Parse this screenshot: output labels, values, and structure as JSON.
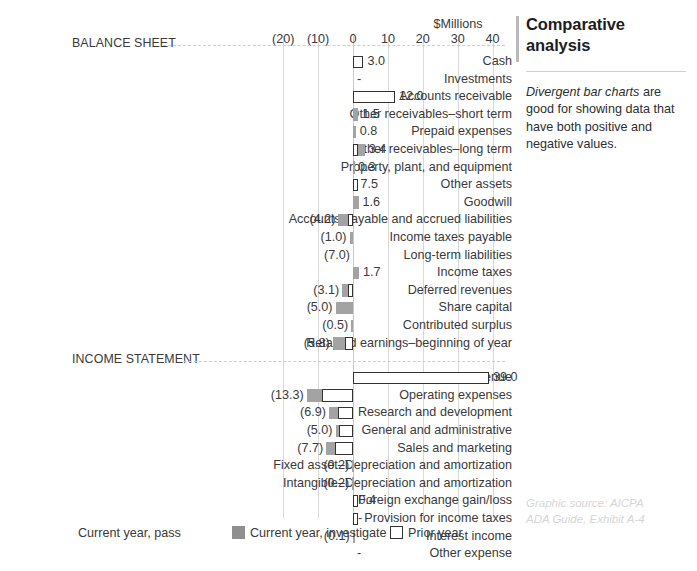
{
  "chart_data": {
    "type": "bar",
    "title": "",
    "xlabel": "$Millions",
    "ylabel": "",
    "orientation": "horizontal",
    "divergent": true,
    "xlim": [
      -25,
      45
    ],
    "xticks": [
      -20,
      -10,
      0,
      10,
      20,
      30,
      40
    ],
    "xtick_labels": [
      "(20)",
      "(10)",
      "0",
      "10",
      "20",
      "30",
      "40"
    ],
    "grid": true,
    "units_label": "$Millions",
    "legend": {
      "position": "bottom",
      "entries": [
        {
          "label": "Current year, pass",
          "swatch": "pass",
          "color": "#c9c9c9"
        },
        {
          "label": "Current year, investigate",
          "swatch": "investigate",
          "color": "#8f8f8f"
        },
        {
          "label": "Prior year",
          "swatch": "prior",
          "color": "#ffffff"
        }
      ]
    },
    "sections": [
      {
        "name": "BALANCE SHEET",
        "rows": [
          {
            "label": "Cash",
            "current_year": 0.0,
            "prior_year": 3.0,
            "value_label": "3.0",
            "sign": "pos"
          },
          {
            "label": "Investments",
            "current_year": 0.0,
            "prior_year": 0.0,
            "value_label": "-",
            "sign": "pos"
          },
          {
            "label": "Accounts receivable",
            "current_year": 0.0,
            "prior_year": 12.0,
            "value_label": "12.0",
            "sign": "pos"
          },
          {
            "label": "Other receivables–short term",
            "current_year": 1.5,
            "prior_year": 0.0,
            "value_label": "1.5",
            "sign": "pos"
          },
          {
            "label": "Prepaid expenses",
            "current_year": 0.8,
            "prior_year": 0.0,
            "value_label": "0.8",
            "sign": "pos"
          },
          {
            "label": "Other receivables–long term",
            "current_year": 3.4,
            "prior_year": 1.2,
            "value_label": "3.4",
            "sign": "pos"
          },
          {
            "label": "Property, plant, and equipment",
            "current_year": 0.3,
            "prior_year": 0.0,
            "value_label": "0.3",
            "sign": "pos"
          },
          {
            "label": "Other assets",
            "current_year": 0.0,
            "prior_year": 1.0,
            "value_label": "7.5",
            "sign": "pos"
          },
          {
            "label": "Goodwill",
            "current_year": 1.6,
            "prior_year": 0.0,
            "value_label": "1.6",
            "sign": "pos"
          },
          {
            "label": "Accounts payable and accrued liabilities",
            "current_year": -4.2,
            "prior_year": -1.4,
            "value_label": "(4.2)",
            "sign": "neg"
          },
          {
            "label": "Income taxes payable",
            "current_year": -1.0,
            "prior_year": 0.0,
            "value_label": "(1.0)",
            "sign": "neg"
          },
          {
            "label": "Long-term liabilities",
            "current_year": 0.0,
            "prior_year": 0.0,
            "value_label": "(7.0)",
            "sign": "neg"
          },
          {
            "label": "Income taxes",
            "current_year": 1.7,
            "prior_year": 0.0,
            "value_label": "1.7",
            "sign": "pos"
          },
          {
            "label": "Deferred revenues",
            "current_year": -3.1,
            "prior_year": -1.4,
            "value_label": "(3.1)",
            "sign": "neg"
          },
          {
            "label": "Share capital",
            "current_year": -5.0,
            "prior_year": 0.0,
            "value_label": "(5.0)",
            "sign": "neg"
          },
          {
            "label": "Contributed surplus",
            "current_year": -0.5,
            "prior_year": 0.0,
            "value_label": "(0.5)",
            "sign": "neg"
          },
          {
            "label": "Retained earnings–beginning of year",
            "current_year": -5.8,
            "prior_year": -2.4,
            "value_label": "(5.8)",
            "sign": "neg"
          }
        ]
      },
      {
        "name": "INCOME STATEMENT",
        "rows": [
          {
            "label": "Sales/revenue",
            "current_year": 0.0,
            "prior_year": 39.0,
            "value_label": "39.0",
            "sign": "pos"
          },
          {
            "label": "Operating expenses",
            "current_year": -13.3,
            "prior_year": -9.0,
            "value_label": "(13.3)",
            "sign": "neg"
          },
          {
            "label": "Research and development",
            "current_year": -6.9,
            "prior_year": -4.4,
            "value_label": "(6.9)",
            "sign": "neg"
          },
          {
            "label": "General and administrative",
            "current_year": -5.0,
            "prior_year": -4.0,
            "value_label": "(5.0)",
            "sign": "neg"
          },
          {
            "label": "Sales and marketing",
            "current_year": -7.7,
            "prior_year": -5.2,
            "value_label": "(7.7)",
            "sign": "neg"
          },
          {
            "label": "Fixed asset–Depreciation and amortization",
            "current_year": -0.2,
            "prior_year": 0.0,
            "value_label": "(0.2)",
            "sign": "neg"
          },
          {
            "label": "Intangible–Depreciation and amortization",
            "current_year": -0.2,
            "prior_year": 0.0,
            "value_label": "(0.2)",
            "sign": "neg"
          },
          {
            "label": "Foreign exchange gain/loss",
            "current_year": 0.4,
            "prior_year": 0.35,
            "value_label": "0.4",
            "sign": "pos"
          },
          {
            "label": "Provision for income taxes",
            "current_year": 0.0,
            "prior_year": 0.3,
            "value_label": "-",
            "sign": "pos"
          },
          {
            "label": "Interest income",
            "current_year": -0.1,
            "prior_year": 0.0,
            "value_label": "(0.1)",
            "sign": "neg"
          },
          {
            "label": "Other expense",
            "current_year": 0.0,
            "prior_year": 0.0,
            "value_label": "-",
            "sign": "pos"
          }
        ]
      }
    ]
  },
  "side_panel": {
    "title": "Comparative analysis",
    "body_emphasis": "Divergent bar charts",
    "body_rest": " are good for showing data that have both positive and negative values."
  },
  "credit": {
    "line1": "Graphic source: AICPA",
    "line2": "ADA Guide, Exhibit A-4"
  },
  "colors": {
    "current_year_pass": "#c9c9c9",
    "current_year_investigate": "#8f8f8f",
    "prior_year_fill": "#ffffff",
    "prior_year_stroke": "#333333",
    "gridline": "#d9d9d9",
    "text": "#3a3a3a",
    "accent_bar": "#b9b9b9"
  }
}
